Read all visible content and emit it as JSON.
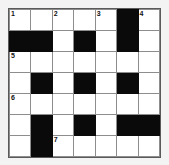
{
  "puzzle": {
    "title": "Crossword Grid",
    "rows": 7,
    "columns": 7,
    "colors": {
      "background": "#f3f3f3",
      "cell_fill": "#ffffff",
      "block_fill": "#0a0a0a",
      "cell_border": "#8d8d8d",
      "frame_border": "#5a5a5a",
      "number_color": "#111111"
    },
    "grid": [
      [
        {
          "type": "white",
          "number": "1",
          "letter": ""
        },
        {
          "type": "white",
          "number": "",
          "letter": ""
        },
        {
          "type": "white",
          "number": "2",
          "letter": ""
        },
        {
          "type": "white",
          "number": "",
          "letter": ""
        },
        {
          "type": "white",
          "number": "3",
          "letter": ""
        },
        {
          "type": "block",
          "number": "",
          "letter": ""
        },
        {
          "type": "white",
          "number": "4",
          "letter": ""
        }
      ],
      [
        {
          "type": "block",
          "number": "",
          "letter": ""
        },
        {
          "type": "block",
          "number": "",
          "letter": ""
        },
        {
          "type": "white",
          "number": "",
          "letter": ""
        },
        {
          "type": "block",
          "number": "",
          "letter": ""
        },
        {
          "type": "white",
          "number": "",
          "letter": ""
        },
        {
          "type": "block",
          "number": "",
          "letter": ""
        },
        {
          "type": "white",
          "number": "",
          "letter": ""
        }
      ],
      [
        {
          "type": "white",
          "number": "5",
          "letter": ""
        },
        {
          "type": "white",
          "number": "",
          "letter": ""
        },
        {
          "type": "white",
          "number": "",
          "letter": ""
        },
        {
          "type": "white",
          "number": "",
          "letter": ""
        },
        {
          "type": "white",
          "number": "",
          "letter": ""
        },
        {
          "type": "white",
          "number": "",
          "letter": ""
        },
        {
          "type": "white",
          "number": "",
          "letter": ""
        }
      ],
      [
        {
          "type": "white",
          "number": "",
          "letter": ""
        },
        {
          "type": "block",
          "number": "",
          "letter": ""
        },
        {
          "type": "white",
          "number": "",
          "letter": ""
        },
        {
          "type": "block",
          "number": "",
          "letter": ""
        },
        {
          "type": "white",
          "number": "",
          "letter": ""
        },
        {
          "type": "block",
          "number": "",
          "letter": ""
        },
        {
          "type": "white",
          "number": "",
          "letter": ""
        }
      ],
      [
        {
          "type": "white",
          "number": "6",
          "letter": ""
        },
        {
          "type": "white",
          "number": "",
          "letter": ""
        },
        {
          "type": "white",
          "number": "",
          "letter": ""
        },
        {
          "type": "white",
          "number": "",
          "letter": ""
        },
        {
          "type": "white",
          "number": "",
          "letter": ""
        },
        {
          "type": "white",
          "number": "",
          "letter": ""
        },
        {
          "type": "white",
          "number": "",
          "letter": ""
        }
      ],
      [
        {
          "type": "white",
          "number": "",
          "letter": ""
        },
        {
          "type": "block",
          "number": "",
          "letter": ""
        },
        {
          "type": "white",
          "number": "",
          "letter": ""
        },
        {
          "type": "block",
          "number": "",
          "letter": ""
        },
        {
          "type": "white",
          "number": "",
          "letter": ""
        },
        {
          "type": "block",
          "number": "",
          "letter": ""
        },
        {
          "type": "block",
          "number": "",
          "letter": ""
        }
      ],
      [
        {
          "type": "white",
          "number": "",
          "letter": ""
        },
        {
          "type": "block",
          "number": "",
          "letter": ""
        },
        {
          "type": "white",
          "number": "7",
          "letter": ""
        },
        {
          "type": "white",
          "number": "",
          "letter": ""
        },
        {
          "type": "white",
          "number": "",
          "letter": ""
        },
        {
          "type": "white",
          "number": "",
          "letter": ""
        },
        {
          "type": "white",
          "number": "",
          "letter": ""
        }
      ]
    ]
  }
}
